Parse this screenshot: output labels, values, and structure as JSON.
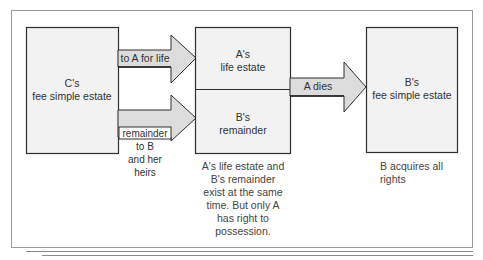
{
  "diagram": {
    "colors": {
      "box_fill": "#f2f2f2",
      "arrow_fill": "#dcdcdc",
      "stroke": "#2e2e2e",
      "frame": "#9a9a9a"
    },
    "boxes": {
      "grantor": {
        "line1": "C's",
        "line2": "fee simple estate"
      },
      "life_estate": {
        "line1": "A's",
        "line2": "life estate"
      },
      "remainder": {
        "line1": "B's",
        "line2": "remainder"
      },
      "final": {
        "line1": "B's",
        "line2": "fee simple estate"
      }
    },
    "arrows": {
      "to_a": {
        "label": "to A for life"
      },
      "to_b": {
        "label": "remainder\nto B\nand her\nheirs",
        "lines": [
          "remainder",
          "to B",
          "and her",
          "heirs"
        ]
      },
      "a_dies": {
        "label": "A dies"
      }
    },
    "captions": {
      "middle": [
        "A's life estate and",
        "B's remainder",
        "exist at the same",
        "time. But only A",
        "has right to",
        "possession."
      ],
      "right": [
        "B acquires all",
        "rights"
      ]
    }
  }
}
